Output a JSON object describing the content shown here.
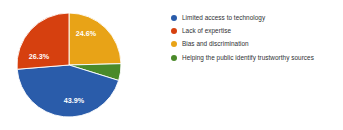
{
  "chart_data": {
    "type": "pie",
    "title": "",
    "subtitle": "",
    "xlabel": "",
    "ylabel": "",
    "grid": false,
    "legend_position": "right",
    "value_suffix": "%",
    "categories": [
      "Limited access to technology",
      "Lack of expertise",
      "Bias and discrimination",
      "Helping the public identify trustworthy sources"
    ],
    "values": [
      43.9,
      26.3,
      24.6,
      5.2
    ],
    "colors": [
      "#2a5caa",
      "#d6400f",
      "#e8a317",
      "#4a8a2a"
    ],
    "slice_labels": [
      "43.9%",
      "26.3%",
      "24.6%",
      ""
    ],
    "slices": [
      {
        "label": "Limited access to technology",
        "value": 43.9,
        "display": "43.9%",
        "color": "#2a5caa",
        "label_x": 74,
        "label_y": 101
      },
      {
        "label": "Lack of expertise",
        "value": 26.3,
        "display": "26.3%",
        "color": "#d6400f",
        "label_x": 39,
        "label_y": 57
      },
      {
        "label": "Bias and discrimination",
        "value": 24.6,
        "display": "24.6%",
        "color": "#e8a317",
        "label_x": 86,
        "label_y": 34
      },
      {
        "label": "Helping the public identify trustworthy sources",
        "value": 5.2,
        "display": "",
        "color": "#4a8a2a",
        "label_x": 112,
        "label_y": 64
      }
    ]
  },
  "legend": {
    "items": [
      {
        "label": "Limited access to technology",
        "color": "#2a5caa",
        "marker": "circle-marker-icon"
      },
      {
        "label": "Lack of expertise",
        "color": "#d6400f",
        "marker": "circle-marker-icon"
      },
      {
        "label": "Bias and discrimination",
        "color": "#e8a317",
        "marker": "circle-marker-icon"
      },
      {
        "label": "Helping the public identify trustworthy sources",
        "color": "#4a8a2a",
        "marker": "circle-marker-icon"
      }
    ]
  }
}
